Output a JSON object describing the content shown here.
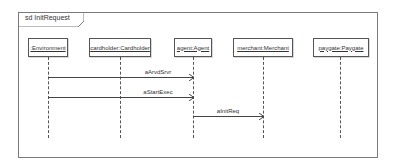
{
  "diagram": {
    "type": "sequence",
    "frame_title": "sd InitRequest",
    "lifelines": [
      {
        "id": "environment",
        "label": ":Environment",
        "x": 48,
        "box_left": 28,
        "box_width": 40
      },
      {
        "id": "cardholder",
        "label": "cardholder:Cardholder",
        "x": 120,
        "box_left": 89,
        "box_width": 62
      },
      {
        "id": "agent",
        "label": "agent:Agent",
        "x": 193,
        "box_left": 174,
        "box_width": 38
      },
      {
        "id": "merchant",
        "label": "merchant:Merchant",
        "x": 263,
        "box_left": 233,
        "box_width": 60
      },
      {
        "id": "paygate",
        "label": "paygate:Paygate",
        "x": 340,
        "box_left": 313,
        "box_width": 56
      }
    ],
    "messages": [
      {
        "label": "aArvdSrvr",
        "from": "environment",
        "to": "agent",
        "y": 77
      },
      {
        "label": "aStartExec",
        "from": "environment",
        "to": "agent",
        "y": 97
      },
      {
        "label": "aInitReq",
        "from": "agent",
        "to": "merchant",
        "y": 116
      }
    ]
  }
}
